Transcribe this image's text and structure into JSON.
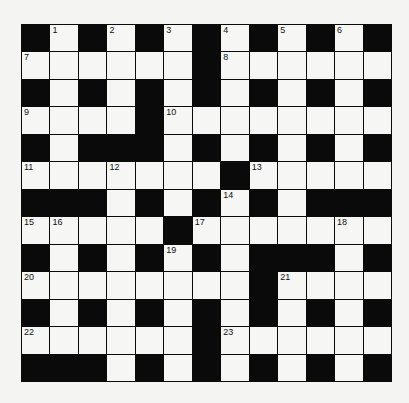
{
  "puzzle": {
    "size": 13,
    "rows": [
      "#.#.#.#.#.#.#",
      "......#......",
      "#.#.#.#.#.#.#",
      "....#........",
      "#.###.#.#.#.#",
      ".......#.....",
      "###.#.#.#.###",
      ".....#.......",
      "#.#.#.#.###.#",
      "........#....",
      "#.#.#.#.#.#.#",
      "......#......",
      "###.#.#.#.#.#"
    ],
    "numbers": [
      {
        "row": 0,
        "col": 1,
        "n": "1"
      },
      {
        "row": 0,
        "col": 3,
        "n": "2"
      },
      {
        "row": 0,
        "col": 5,
        "n": "3"
      },
      {
        "row": 0,
        "col": 7,
        "n": "4"
      },
      {
        "row": 0,
        "col": 9,
        "n": "5"
      },
      {
        "row": 0,
        "col": 11,
        "n": "6"
      },
      {
        "row": 1,
        "col": 0,
        "n": "7"
      },
      {
        "row": 1,
        "col": 7,
        "n": "8"
      },
      {
        "row": 3,
        "col": 0,
        "n": "9"
      },
      {
        "row": 3,
        "col": 5,
        "n": "10"
      },
      {
        "row": 5,
        "col": 0,
        "n": "11"
      },
      {
        "row": 5,
        "col": 3,
        "n": "12"
      },
      {
        "row": 5,
        "col": 8,
        "n": "13"
      },
      {
        "row": 6,
        "col": 7,
        "n": "14"
      },
      {
        "row": 7,
        "col": 0,
        "n": "15"
      },
      {
        "row": 7,
        "col": 1,
        "n": "16"
      },
      {
        "row": 7,
        "col": 6,
        "n": "17"
      },
      {
        "row": 7,
        "col": 11,
        "n": "18"
      },
      {
        "row": 8,
        "col": 5,
        "n": "19"
      },
      {
        "row": 9,
        "col": 0,
        "n": "20"
      },
      {
        "row": 9,
        "col": 9,
        "n": "21"
      },
      {
        "row": 11,
        "col": 0,
        "n": "22"
      },
      {
        "row": 11,
        "col": 7,
        "n": "23"
      }
    ]
  },
  "colors": {
    "block": "#0a0a0a",
    "cell": "#f6f6f4",
    "background": "#f4f4f2"
  }
}
